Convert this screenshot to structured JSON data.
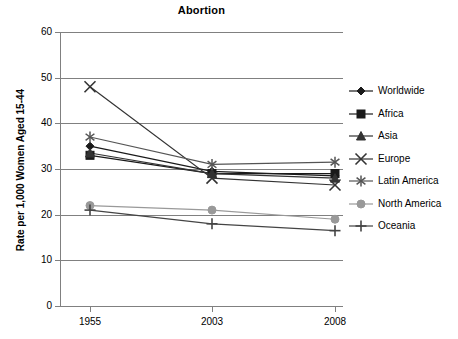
{
  "chart_data": {
    "type": "line",
    "title": "Abortion",
    "xlabel": "",
    "ylabel": "Rate per 1,000 Women Aged 15-44",
    "categories": [
      "1955",
      "2003",
      "2008"
    ],
    "x_tick_labels": [
      "1955",
      "2003",
      "2008"
    ],
    "y_tick_labels": [
      "0",
      "10",
      "20",
      "30",
      "40",
      "50",
      "60"
    ],
    "y_ticks": [
      0,
      10,
      20,
      30,
      40,
      50,
      60
    ],
    "ylim": [
      0,
      60
    ],
    "grid": "horizontal",
    "legend_position": "right",
    "series": [
      {
        "name": "Worldwide",
        "marker": "diamond",
        "color": "#1a1a1a",
        "values": [
          35,
          29.5,
          28.5
        ]
      },
      {
        "name": "Africa",
        "marker": "square",
        "color": "#1a1a1a",
        "values": [
          33,
          29,
          29
        ]
      },
      {
        "name": "Asia",
        "marker": "triangle",
        "color": "#333333",
        "values": [
          33.5,
          29,
          28
        ]
      },
      {
        "name": "Europe",
        "marker": "x-cross",
        "color": "#333333",
        "values": [
          48,
          28,
          26.5
        ]
      },
      {
        "name": "Latin America",
        "marker": "asterisk",
        "color": "#555555",
        "values": [
          37,
          31,
          31.5
        ]
      },
      {
        "name": "North America",
        "marker": "circle",
        "color": "#999999",
        "values": [
          22,
          21,
          19
        ]
      },
      {
        "name": "Oceania",
        "marker": "plus",
        "color": "#444444",
        "values": [
          21,
          18,
          16.5
        ]
      }
    ]
  },
  "legend": {
    "items": [
      {
        "label": "Worldwide"
      },
      {
        "label": "Africa"
      },
      {
        "label": "Asia"
      },
      {
        "label": "Europe"
      },
      {
        "label": "Latin America"
      },
      {
        "label": "North America"
      },
      {
        "label": "Oceania"
      }
    ]
  }
}
